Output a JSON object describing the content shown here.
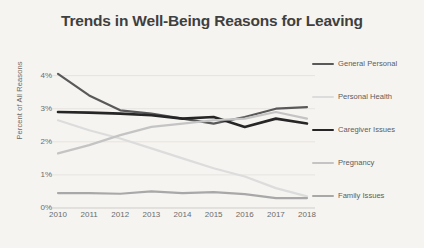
{
  "chart_data": {
    "type": "line",
    "title": "Trends in Well-Being Reasons for Leaving",
    "xlabel": "",
    "ylabel": "Percent of All Reasons",
    "categories": [
      "2010",
      "2011",
      "2012",
      "2013",
      "2014",
      "2015",
      "2016",
      "2017",
      "2018"
    ],
    "x": [
      2010,
      2011,
      2012,
      2013,
      2014,
      2015,
      2016,
      2017,
      2018
    ],
    "ylim": [
      0,
      4.35
    ],
    "xlim": [
      2010,
      2018
    ],
    "y_ticks": [
      0,
      1,
      2,
      3,
      4
    ],
    "y_tick_labels": [
      "0%",
      "1%",
      "2%",
      "3%",
      "4%"
    ],
    "grid": true,
    "grid_axis": "y",
    "legend_position": "right",
    "series": [
      {
        "name": "General Personal",
        "color": "#595959",
        "width": 2.2,
        "values": [
          4.05,
          3.4,
          2.95,
          2.85,
          2.7,
          2.55,
          2.75,
          3.0,
          3.05
        ]
      },
      {
        "name": "Personal Health",
        "color": "#dcdcdc",
        "width": 2.2,
        "values": [
          2.65,
          2.35,
          2.1,
          1.8,
          1.5,
          1.2,
          0.95,
          0.6,
          0.35
        ]
      },
      {
        "name": "Caregiver Issues",
        "color": "#262626",
        "width": 2.6,
        "values": [
          2.9,
          2.88,
          2.85,
          2.8,
          2.7,
          2.75,
          2.45,
          2.7,
          2.55
        ]
      },
      {
        "name": "Pregnancy",
        "color": "#c4c4c4",
        "width": 2.2,
        "values": [
          1.65,
          1.9,
          2.2,
          2.45,
          2.55,
          2.65,
          2.7,
          2.9,
          2.7
        ]
      },
      {
        "name": "Family Issues",
        "color": "#a8a8a8",
        "width": 2.2,
        "values": [
          0.45,
          0.45,
          0.43,
          0.5,
          0.45,
          0.48,
          0.42,
          0.3,
          0.3
        ]
      }
    ],
    "colors": {
      "background": "#f6f4f0",
      "title": "#3f3f3f",
      "tick_label": "#6b6b6b",
      "gridline": "#e2e0dc",
      "axis": "#cfcdc9"
    }
  }
}
